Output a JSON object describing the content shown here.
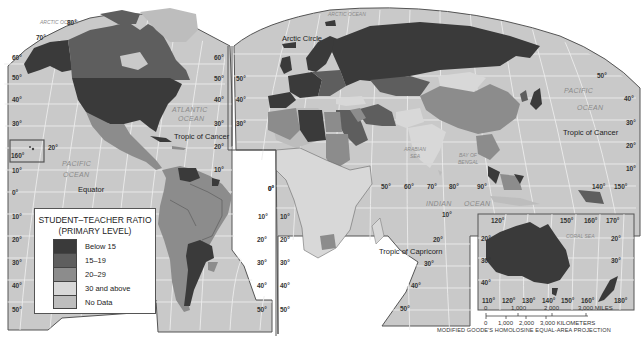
{
  "map": {
    "title": "STUDENT–TEACHER RATIO (PRIMARY LEVEL)",
    "projection": "MODIFIED GOODE'S HOMOLOSINE EQUAL-AREA PROJECTION",
    "colors": {
      "ocean": "#c9c9c9",
      "graticule": "#ececec",
      "border": "#555555",
      "below_15": "#3a3a3a",
      "r15_19": "#5e5e5e",
      "r20_29": "#8c8c8c",
      "r30_above": "#d8d8d8",
      "no_data": "#bdbdbd"
    }
  },
  "legend": {
    "title_line1": "STUDENT–TEACHER RATIO",
    "title_line2": "(PRIMARY LEVEL)",
    "items": [
      {
        "label": "Below 15",
        "color": "#3a3a3a"
      },
      {
        "label": "15–19",
        "color": "#5e5e5e"
      },
      {
        "label": "20–29",
        "color": "#8c8c8c"
      },
      {
        "label": "30 and above",
        "color": "#d8d8d8"
      },
      {
        "label": "No Data",
        "color": "#bdbdbd"
      }
    ]
  },
  "labels": {
    "oceans": {
      "arctic_left": "ARCTIC OCEAN",
      "arctic_right": "ARCTIC OCEAN",
      "atlantic_1": "ATLANTIC",
      "atlantic_2": "OCEAN",
      "pacific_left_1": "PACIFIC",
      "pacific_left_2": "OCEAN",
      "pacific_right_1": "PACIFIC",
      "pacific_right_2": "OCEAN",
      "indian_1": "INDIAN",
      "indian_2": "OCEAN",
      "arabian_sea_1": "ARABIAN",
      "arabian_sea_2": "SEA",
      "bay_of_bengal_1": "BAY OF",
      "bay_of_bengal_2": "BENGAL",
      "coral_sea": "CORAL SEA"
    },
    "lines": {
      "arctic_circle": "Arctic Circle",
      "tropic_cancer_left": "Tropic of Cancer",
      "tropic_cancer_right": "Tropic of Cancer",
      "equator": "Equator",
      "tropic_capricorn": "Tropic of Capricorn"
    }
  },
  "degrees": {
    "left_lat": [
      "70°",
      "60°",
      "50°",
      "40°",
      "30°",
      "20°",
      "160°",
      "10°",
      "0°",
      "10°",
      "20°",
      "30°",
      "40°",
      "50°"
    ],
    "mid_left_lat": [
      "80°",
      "60°",
      "50°",
      "40°",
      "30°",
      "20°",
      "10°"
    ],
    "sa_right_lat": [
      "10°",
      "20°",
      "30°",
      "40°",
      "50°"
    ],
    "mid_lat": [
      "50°",
      "40°",
      "30°",
      "0°",
      "10°",
      "20°",
      "30°",
      "40°",
      "50°"
    ],
    "africa_lon": [
      "0°",
      "50°",
      "60°",
      "70°",
      "80°",
      "90°"
    ],
    "asia_right_lat": [
      "50°",
      "40°",
      "30°",
      "20°",
      "10°"
    ],
    "asia_lon": [
      "140°",
      "150°"
    ],
    "indian_lat": [
      "10°",
      "20°",
      "30°",
      "40°",
      "50°"
    ],
    "aus_top": [
      "120°",
      "150°",
      "160°",
      "170°"
    ],
    "aus_left": [
      "20°",
      "30°",
      "40°"
    ],
    "aus_right": [
      "20°",
      "30°"
    ],
    "aus_bottom": [
      "110°",
      "120°",
      "130°",
      "140°",
      "150°",
      "160°",
      "180°"
    ]
  },
  "scale": {
    "miles": [
      "0",
      "1,000",
      "2,000",
      "3,000 MILES"
    ],
    "km": [
      "0",
      "1,000",
      "2,000",
      "3,000 KILOMETERS"
    ]
  }
}
